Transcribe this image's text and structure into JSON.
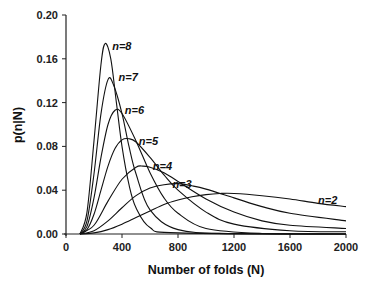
{
  "chart_data": {
    "type": "line",
    "title": "",
    "xlabel": "Number of folds (N)",
    "ylabel": "p(n|N)",
    "xlim": [
      0,
      2000
    ],
    "ylim": [
      0,
      0.2
    ],
    "xticks": [
      0,
      400,
      800,
      1200,
      1600,
      2000
    ],
    "xtick_labels": [
      "0",
      "400",
      "800",
      "1200",
      "1600",
      "2000"
    ],
    "yticks": [
      0,
      0.04,
      0.08,
      0.12,
      0.16,
      0.2
    ],
    "ytick_labels": [
      "0.00",
      "0.04",
      "0.08",
      "0.12",
      "0.16",
      "0.20"
    ],
    "grid": false,
    "legend": "inline annotations",
    "series": [
      {
        "name": "n=8",
        "label": "n=8",
        "label_pos": [
          330,
          0.172
        ],
        "points": [
          [
            100,
            0
          ],
          [
            150,
            0.02
          ],
          [
            200,
            0.085
          ],
          [
            250,
            0.155
          ],
          [
            280,
            0.174
          ],
          [
            320,
            0.16
          ],
          [
            360,
            0.12
          ],
          [
            400,
            0.08
          ],
          [
            450,
            0.045
          ],
          [
            500,
            0.024
          ],
          [
            600,
            0.006
          ],
          [
            800,
            0.001
          ],
          [
            2000,
            0
          ]
        ]
      },
      {
        "name": "n=7",
        "label": "n=7",
        "label_pos": [
          375,
          0.143
        ],
        "points": [
          [
            100,
            0
          ],
          [
            150,
            0.012
          ],
          [
            200,
            0.055
          ],
          [
            250,
            0.11
          ],
          [
            300,
            0.141
          ],
          [
            340,
            0.136
          ],
          [
            400,
            0.11
          ],
          [
            450,
            0.08
          ],
          [
            500,
            0.055
          ],
          [
            600,
            0.022
          ],
          [
            800,
            0.004
          ],
          [
            1200,
            0.0003
          ],
          [
            2000,
            0
          ]
        ]
      },
      {
        "name": "n=6",
        "label": "n=6",
        "label_pos": [
          420,
          0.113
        ],
        "points": [
          [
            100,
            0
          ],
          [
            150,
            0.007
          ],
          [
            200,
            0.033
          ],
          [
            250,
            0.07
          ],
          [
            300,
            0.1
          ],
          [
            350,
            0.113
          ],
          [
            400,
            0.11
          ],
          [
            500,
            0.085
          ],
          [
            600,
            0.056
          ],
          [
            700,
            0.033
          ],
          [
            800,
            0.019
          ],
          [
            1000,
            0.005
          ],
          [
            1400,
            0.0005
          ],
          [
            2000,
            0
          ]
        ]
      },
      {
        "name": "n=5",
        "label": "n=5",
        "label_pos": [
          520,
          0.085
        ],
        "points": [
          [
            100,
            0
          ],
          [
            150,
            0.004
          ],
          [
            200,
            0.018
          ],
          [
            250,
            0.04
          ],
          [
            300,
            0.062
          ],
          [
            350,
            0.078
          ],
          [
            400,
            0.086
          ],
          [
            450,
            0.087
          ],
          [
            500,
            0.084
          ],
          [
            600,
            0.07
          ],
          [
            700,
            0.054
          ],
          [
            800,
            0.04
          ],
          [
            1000,
            0.02
          ],
          [
            1200,
            0.009
          ],
          [
            1600,
            0.003
          ],
          [
            2000,
            0.002
          ]
        ]
      },
      {
        "name": "n=4",
        "label": "n=4",
        "label_pos": [
          620,
          0.062
        ],
        "points": [
          [
            100,
            0
          ],
          [
            200,
            0.008
          ],
          [
            300,
            0.03
          ],
          [
            400,
            0.05
          ],
          [
            500,
            0.061
          ],
          [
            550,
            0.062
          ],
          [
            600,
            0.061
          ],
          [
            700,
            0.056
          ],
          [
            800,
            0.048
          ],
          [
            1000,
            0.032
          ],
          [
            1200,
            0.02
          ],
          [
            1400,
            0.012
          ],
          [
            1600,
            0.008
          ],
          [
            2000,
            0.005
          ]
        ]
      },
      {
        "name": "n=3",
        "label": "n=3",
        "label_pos": [
          760,
          0.046
        ],
        "points": [
          [
            100,
            0
          ],
          [
            200,
            0.003
          ],
          [
            300,
            0.012
          ],
          [
            400,
            0.024
          ],
          [
            500,
            0.035
          ],
          [
            600,
            0.042
          ],
          [
            700,
            0.045
          ],
          [
            800,
            0.046
          ],
          [
            900,
            0.044
          ],
          [
            1000,
            0.041
          ],
          [
            1200,
            0.033
          ],
          [
            1400,
            0.025
          ],
          [
            1600,
            0.019
          ],
          [
            2000,
            0.012
          ]
        ]
      },
      {
        "name": "n=2",
        "label": "n=2",
        "label_pos": [
          1800,
          0.031
        ],
        "points": [
          [
            100,
            0
          ],
          [
            200,
            0.001
          ],
          [
            300,
            0.004
          ],
          [
            400,
            0.009
          ],
          [
            500,
            0.015
          ],
          [
            600,
            0.021
          ],
          [
            700,
            0.027
          ],
          [
            800,
            0.031
          ],
          [
            900,
            0.034
          ],
          [
            1000,
            0.036
          ],
          [
            1100,
            0.037
          ],
          [
            1200,
            0.037
          ],
          [
            1400,
            0.035
          ],
          [
            1600,
            0.032
          ],
          [
            1800,
            0.028
          ],
          [
            2000,
            0.025
          ]
        ]
      }
    ]
  }
}
